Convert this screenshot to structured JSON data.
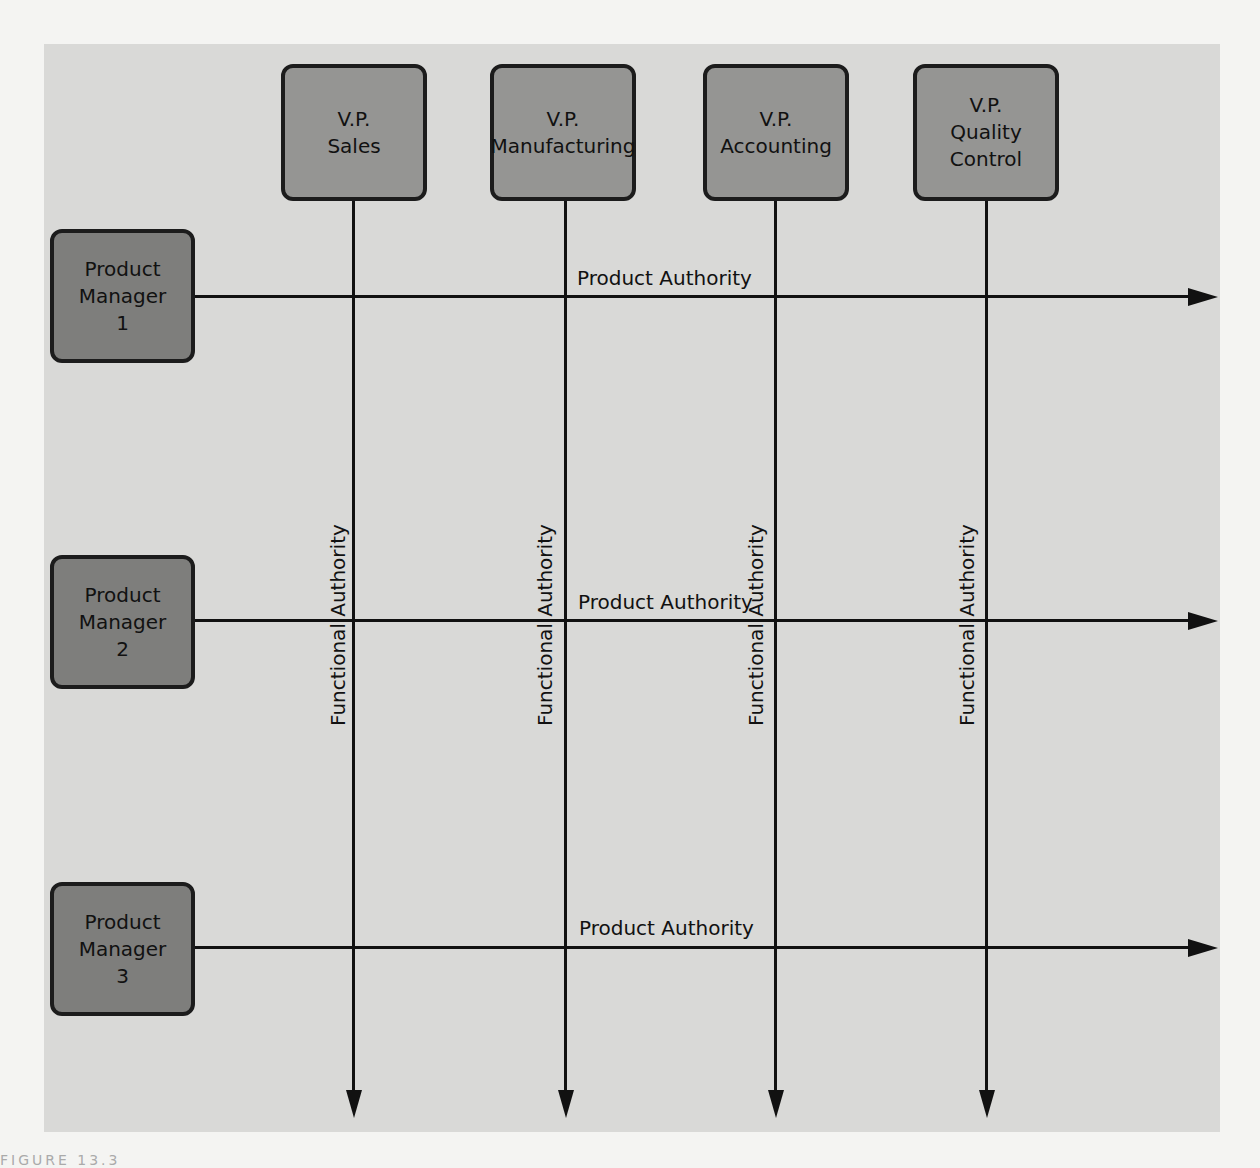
{
  "diagram": {
    "type": "matrix organization chart",
    "vps": [
      {
        "line1": "V.P.",
        "line2": "Sales",
        "line3": ""
      },
      {
        "line1": "V.P.",
        "line2": "Manufacturing",
        "line3": ""
      },
      {
        "line1": "V.P.",
        "line2": "Accounting",
        "line3": ""
      },
      {
        "line1": "V.P.",
        "line2": "Quality",
        "line3": "Control"
      }
    ],
    "product_managers": [
      {
        "line1": "Product",
        "line2": "Manager",
        "line3": "1"
      },
      {
        "line1": "Product",
        "line2": "Manager",
        "line3": "2"
      },
      {
        "line1": "Product",
        "line2": "Manager",
        "line3": "3"
      }
    ],
    "product_authority_label": "Product Authority",
    "functional_authority_label": "Functional Authority",
    "caption_fragment": "FIGURE 13.3"
  }
}
